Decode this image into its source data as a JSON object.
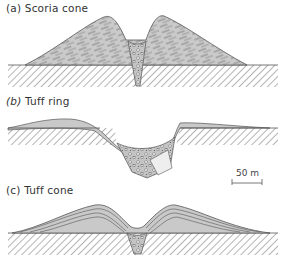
{
  "panels": [
    {
      "letter": "(a)",
      "title": "Scoria cone"
    },
    {
      "letter": "(b)",
      "title": "Tuff ring"
    },
    {
      "letter": "(c)",
      "title": "Tuff cone"
    }
  ],
  "scale_bar": {
    "label": "50 m"
  },
  "colors": {
    "deposit_fill": "#c9c9c9",
    "outline": "#555555",
    "hatch": "#6a6a6a",
    "background": "#ffffff"
  }
}
